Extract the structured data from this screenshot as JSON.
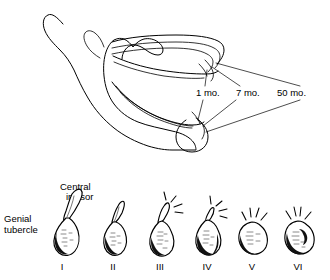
{
  "figure": {
    "background_color": "#ffffff",
    "ink_color": "#000000",
    "panels": {
      "top": {
        "name": "mandible-resorption-profile",
        "description": "Lateral line drawing of a mandible with three superimposed alveolar ridge contours showing progressive residual ridge resorption",
        "time_labels": [
          {
            "id": "t1",
            "text": "1 mo.",
            "x": 196,
            "y": 96
          },
          {
            "id": "t7",
            "text": "7 mo.",
            "x": 236,
            "y": 96
          },
          {
            "id": "t50",
            "text": "50 mo.",
            "x": 277,
            "y": 96
          }
        ]
      },
      "bottom": {
        "name": "genial-tubercle-resorption-stages",
        "description": "Six-stage series of the mandibular anterior segment in cross-section showing loss of the central incisor and progressive prominence of the genial tubercle",
        "callouts": [
          {
            "id": "central-incisor",
            "line1": "Central",
            "line2": "incisor",
            "x": 60,
            "y1": 190,
            "y2": 200
          },
          {
            "id": "genial-tubercle",
            "line1": "Genial",
            "line2": "tubercle",
            "x": 4,
            "y1": 222,
            "y2": 233
          }
        ],
        "stage_labels": [
          {
            "numeral": "I",
            "cx": 62
          },
          {
            "numeral": "II",
            "cx": 113
          },
          {
            "numeral": "III",
            "cx": 160
          },
          {
            "numeral": "IV",
            "cx": 207
          },
          {
            "numeral": "V",
            "cx": 252
          },
          {
            "numeral": "VI",
            "cx": 298
          }
        ],
        "stage_label_baseline_y": 270
      }
    }
  }
}
